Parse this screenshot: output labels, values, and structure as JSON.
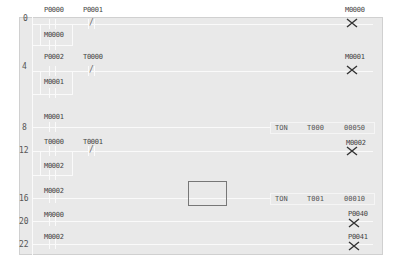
{
  "diagram": {
    "type": "ladder-logic",
    "rungs": [
      {
        "step": "0",
        "contacts": [
          {
            "addr": "P0000",
            "type": "NO"
          },
          {
            "addr": "P0001",
            "type": "NC"
          }
        ],
        "branch": [
          {
            "addr": "M0000",
            "type": "NO"
          }
        ],
        "output": {
          "type": "coil",
          "addr": "M0000"
        }
      },
      {
        "step": "4",
        "contacts": [
          {
            "addr": "P0002",
            "type": "NO"
          },
          {
            "addr": "T0000",
            "type": "NC"
          }
        ],
        "branch": [
          {
            "addr": "M0001",
            "type": "NO"
          }
        ],
        "output": {
          "type": "coil",
          "addr": "M0001"
        }
      },
      {
        "step": "8",
        "contacts": [
          {
            "addr": "M0001",
            "type": "NO"
          }
        ],
        "output": {
          "type": "timer",
          "fn": "TON",
          "timer": "T000",
          "preset": "00050"
        }
      },
      {
        "step": "12",
        "contacts": [
          {
            "addr": "T0000",
            "type": "NO"
          },
          {
            "addr": "T0001",
            "type": "NC"
          }
        ],
        "branch": [
          {
            "addr": "M0002",
            "type": "NO"
          }
        ],
        "output": {
          "type": "coil",
          "addr": "M0002"
        }
      },
      {
        "step": "16",
        "contacts": [
          {
            "addr": "M0002",
            "type": "NO"
          }
        ],
        "output": {
          "type": "timer",
          "fn": "TON",
          "timer": "T001",
          "preset": "00010"
        }
      },
      {
        "step": "20",
        "contacts": [
          {
            "addr": "M0000",
            "type": "NO"
          }
        ],
        "output": {
          "type": "coil",
          "addr": "P0040"
        }
      },
      {
        "step": "22",
        "contacts": [
          {
            "addr": "M0002",
            "type": "NO"
          }
        ],
        "output": {
          "type": "coil",
          "addr": "P0041"
        }
      }
    ],
    "nc_glyph": "/",
    "colors": {
      "background": "#e9e9e9",
      "wire": "#fafafa",
      "text": "#444444",
      "cursor": "#777777"
    }
  }
}
